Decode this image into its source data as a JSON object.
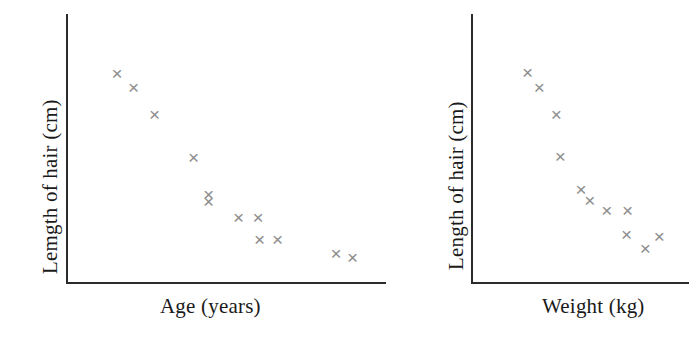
{
  "figure": {
    "marker_color": "#8d8d8d",
    "axis_color": "#2b2b2b",
    "background": "#ffffff",
    "marker_glyph": "×"
  },
  "chart_data": [
    {
      "type": "scatter",
      "panel": "left",
      "title": "",
      "xlabel": "Age (years)",
      "ylabel": "Lemgth of hair (cm)",
      "grid": false,
      "legend": "none",
      "xlim": [
        0,
        100
      ],
      "ylim": [
        0,
        100
      ],
      "axis_ticks": false,
      "tick_labels": [],
      "relationship": "negative",
      "points": [
        {
          "x": 13.0,
          "y": 82.5
        },
        {
          "x": 18.5,
          "y": 76.5
        },
        {
          "x": 25.5,
          "y": 65.5
        },
        {
          "x": 38.5,
          "y": 47.5
        },
        {
          "x": 43.5,
          "y": 32.0
        },
        {
          "x": 43.5,
          "y": 29.0
        },
        {
          "x": 53.5,
          "y": 22.5
        },
        {
          "x": 60.0,
          "y": 22.5
        },
        {
          "x": 60.5,
          "y": 13.5
        },
        {
          "x": 66.5,
          "y": 13.5
        },
        {
          "x": 86.0,
          "y": 7.5
        },
        {
          "x": 91.5,
          "y": 6.0
        }
      ]
    },
    {
      "type": "scatter",
      "panel": "right",
      "title": "",
      "xlabel": "Weight (kg)",
      "ylabel": "Length of hair (cm)",
      "grid": false,
      "legend": "none",
      "xlim": [
        0,
        100
      ],
      "ylim": [
        0,
        100
      ],
      "axis_ticks": false,
      "tick_labels": [],
      "relationship": "negative",
      "points": [
        {
          "x": 22.0,
          "y": 83.0
        },
        {
          "x": 28.0,
          "y": 76.5
        },
        {
          "x": 36.5,
          "y": 65.5
        },
        {
          "x": 38.5,
          "y": 48.0
        },
        {
          "x": 49.0,
          "y": 34.0
        },
        {
          "x": 53.5,
          "y": 29.5
        },
        {
          "x": 62.0,
          "y": 25.5
        },
        {
          "x": 72.5,
          "y": 25.5
        },
        {
          "x": 72.0,
          "y": 15.5
        },
        {
          "x": 88.5,
          "y": 14.5
        },
        {
          "x": 81.5,
          "y": 9.5
        }
      ]
    }
  ]
}
